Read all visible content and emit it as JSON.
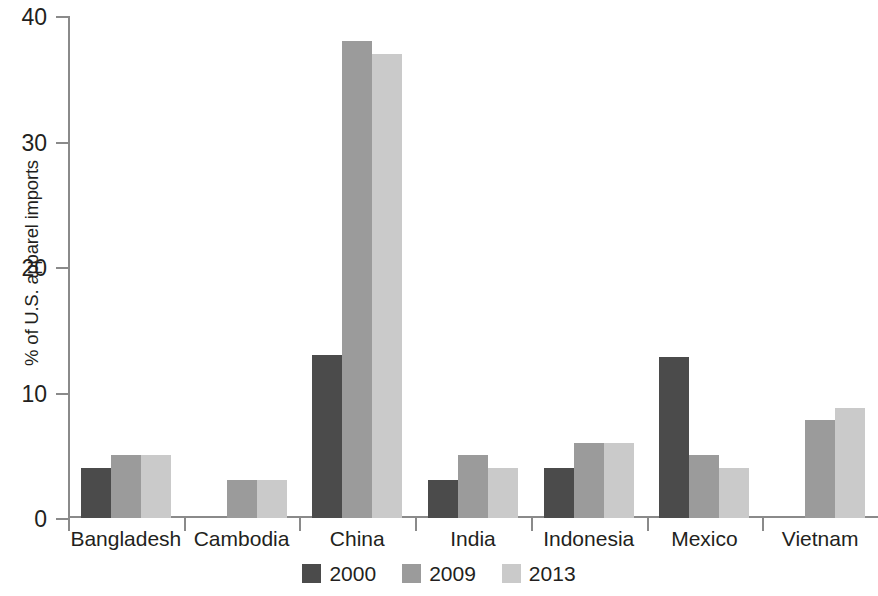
{
  "chart_data": {
    "type": "bar",
    "title": "",
    "xlabel": "",
    "ylabel": "% of U.S. apparel imports",
    "ylim": [
      0,
      40
    ],
    "yticks": [
      0,
      10,
      20,
      30,
      40
    ],
    "grid": false,
    "legend_position": "bottom-center",
    "categories": [
      "Bangladesh",
      "Cambodia",
      "China",
      "India",
      "Indonesia",
      "Mexico",
      "Vietnam"
    ],
    "series": [
      {
        "name": "2000",
        "color": "#4b4b4b",
        "values": [
          4,
          null,
          13,
          3,
          4,
          12.8,
          null
        ]
      },
      {
        "name": "2009",
        "color": "#9b9b9b",
        "values": [
          5,
          3,
          38,
          5,
          6,
          5,
          7.8
        ]
      },
      {
        "name": "2013",
        "color": "#cacaca",
        "values": [
          5,
          3,
          37,
          4,
          6,
          4,
          8.8
        ]
      }
    ]
  },
  "axis": {
    "y_tick_labels": [
      "0",
      "10",
      "20",
      "30",
      "40"
    ],
    "y_axis_title": "% of U.S. apparel imports"
  },
  "legend": {
    "items": [
      {
        "label": "2000",
        "color": "#4b4b4b"
      },
      {
        "label": "2009",
        "color": "#9b9b9b"
      },
      {
        "label": "2013",
        "color": "#cacaca"
      }
    ]
  },
  "colors": {
    "axis": "#8a8a8a",
    "text": "#231f20",
    "background": "#ffffff"
  }
}
